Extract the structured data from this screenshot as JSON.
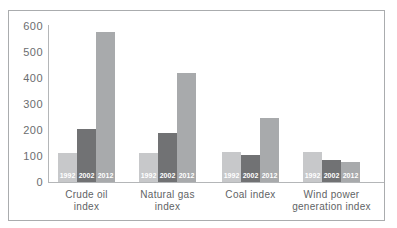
{
  "chart_data": {
    "type": "bar",
    "title": "",
    "xlabel": "",
    "ylabel": "",
    "categories": [
      "Crude oil index",
      "Natural gas index",
      "Coal index",
      "Wind power generation index"
    ],
    "category_label_lines": [
      [
        "Crude oil",
        "index"
      ],
      [
        "Natural gas",
        "index"
      ],
      [
        "Coal index"
      ],
      [
        "Wind power",
        "generation index"
      ]
    ],
    "series": [
      {
        "name": "1992",
        "color": "#c7c8ca",
        "values": [
          110,
          110,
          115,
          115
        ]
      },
      {
        "name": "2002",
        "color": "#717274",
        "values": [
          205,
          190,
          105,
          85
        ]
      },
      {
        "name": "2012",
        "color": "#a8aaac",
        "values": [
          575,
          420,
          245,
          75
        ]
      }
    ],
    "ylim": [
      0,
      600
    ],
    "yticks": [
      0,
      100,
      200,
      300,
      400,
      500,
      600
    ],
    "grid": false,
    "legend": "none (series labels printed in white inside each bar)",
    "colors": {
      "frame_border": "#aaacae",
      "axis_line": "#b4b6b8",
      "tick_text": "#6b6d6f",
      "category_text": "#616365",
      "bar_label_text": "#ffffff",
      "background": "#ffffff"
    }
  }
}
